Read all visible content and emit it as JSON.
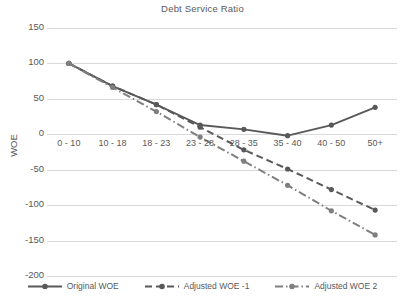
{
  "chart_data": {
    "type": "line",
    "title": "Debt Service Ratio",
    "xlabel": "",
    "ylabel": "WOE",
    "categories": [
      "0 - 10",
      "10 - 18",
      "18 - 23",
      "23 - 28",
      "28 - 35",
      "35 - 40",
      "40 - 50",
      "50+"
    ],
    "ylim": [
      -200,
      150
    ],
    "ytick_values": [
      150,
      100,
      50,
      0,
      -50,
      -100,
      -150,
      -200
    ],
    "ytick_labels": [
      "150",
      "100",
      "50",
      "0",
      "-50",
      "-100",
      "-150",
      "-200"
    ],
    "grid": true,
    "legend_position": "bottom",
    "series": [
      {
        "name": "Original WOE",
        "style": "solid",
        "color": "#595959",
        "values": [
          100,
          68,
          42,
          13,
          7,
          -2,
          13,
          38
        ]
      },
      {
        "name": "Adjusted WOE -1",
        "style": "dashed",
        "color": "#595959",
        "values": [
          100,
          68,
          42,
          10,
          -22,
          -49,
          -78,
          -107
        ]
      },
      {
        "name": "Adjusted WOE 2",
        "style": "dash-dot",
        "color": "#7f7f7f",
        "values": [
          100,
          66,
          32,
          -4,
          -38,
          -72,
          -108,
          -142
        ]
      }
    ]
  },
  "colors": {
    "grid": "#d9d9d9",
    "text": "#595959",
    "background": "#ffffff"
  }
}
